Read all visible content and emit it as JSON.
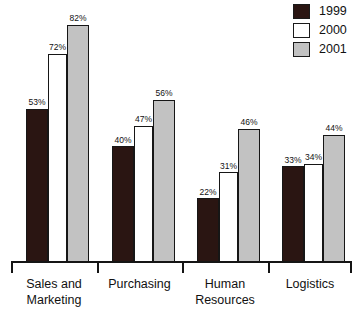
{
  "chart_data": {
    "type": "bar",
    "title": "",
    "subtitle": "",
    "xlabel": "",
    "ylabel": "",
    "ylim": [
      0,
      100
    ],
    "grid": false,
    "legend_position": "top-right",
    "categories": [
      "Sales and Marketing",
      "Purchasing",
      "Human Resources",
      "Logistics"
    ],
    "category_lines": [
      [
        "Sales and",
        "Marketing"
      ],
      [
        "Purchasing",
        ""
      ],
      [
        "Human",
        "Resources"
      ],
      [
        "Logistics",
        ""
      ]
    ],
    "series": [
      {
        "name": "1999",
        "color": "#2a1512",
        "values": [
          53,
          40,
          22,
          33
        ],
        "labels": [
          "53%",
          "40%",
          "22%",
          "33%"
        ]
      },
      {
        "name": "2000",
        "color": "#ffffff",
        "values": [
          72,
          47,
          31,
          34
        ],
        "labels": [
          "72%",
          "47%",
          "31%",
          "34%"
        ]
      },
      {
        "name": "2001",
        "color": "#c2c2c2",
        "values": [
          82,
          56,
          46,
          44
        ],
        "labels": [
          "82%",
          "56%",
          "46%",
          "44%"
        ]
      }
    ]
  },
  "legend": {
    "items": [
      {
        "label": "1999",
        "color": "#2a1512"
      },
      {
        "label": "2000",
        "color": "#ffffff"
      },
      {
        "label": "2001",
        "color": "#c2c2c2"
      }
    ]
  },
  "axis": {
    "line_color": "#151515"
  }
}
